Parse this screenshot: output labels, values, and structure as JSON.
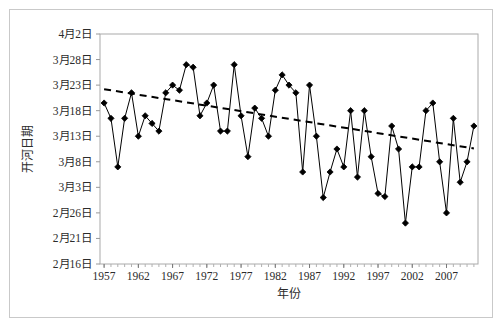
{
  "figure": {
    "background": "#ffffff",
    "border_color": "#c9c9c9"
  },
  "chart_data": {
    "type": "line",
    "title": "",
    "subtitle": "",
    "xlabel": "年份",
    "ylabel": "开河日期",
    "xlim": [
      1956.4,
      2011.6
    ],
    "ylim": [
      0,
      45
    ],
    "grid": false,
    "legend_position": "none",
    "marker": "diamond",
    "marker_color": "#000000",
    "line_color": "#000000",
    "trend_line": {
      "style": "dashed",
      "color": "#000000",
      "start": {
        "x": 1957,
        "y": 34.2
      },
      "end": {
        "x": 2011,
        "y": 22.6
      },
      "description": "下降趋势线"
    },
    "y_ticks": [
      {
        "value": 45,
        "label": "4月2日"
      },
      {
        "value": 40,
        "label": "3月28日"
      },
      {
        "value": 35,
        "label": "3月23日"
      },
      {
        "value": 30,
        "label": "3月18日"
      },
      {
        "value": 25,
        "label": "3月13日"
      },
      {
        "value": 20,
        "label": "3月8日"
      },
      {
        "value": 15,
        "label": "3月3日"
      },
      {
        "value": 10,
        "label": "2月26日"
      },
      {
        "value": 5,
        "label": "2月21日"
      },
      {
        "value": 0,
        "label": "2月16日"
      }
    ],
    "x_ticks": [
      {
        "value": 1957,
        "label": "1957"
      },
      {
        "value": 1962,
        "label": "1962"
      },
      {
        "value": 1967,
        "label": "1967"
      },
      {
        "value": 1972,
        "label": "1972"
      },
      {
        "value": 1977,
        "label": "1977"
      },
      {
        "value": 1982,
        "label": "1982"
      },
      {
        "value": 1987,
        "label": "1987"
      },
      {
        "value": 1992,
        "label": "1992"
      },
      {
        "value": 1997,
        "label": "1997"
      },
      {
        "value": 2002,
        "label": "2002"
      },
      {
        "value": 2007,
        "label": "2007"
      }
    ],
    "x": [
      1957,
      1958,
      1959,
      1960,
      1961,
      1962,
      1963,
      1964,
      1965,
      1966,
      1967,
      1968,
      1969,
      1970,
      1971,
      1972,
      1973,
      1974,
      1975,
      1976,
      1977,
      1978,
      1979,
      1980,
      1981,
      1982,
      1983,
      1984,
      1985,
      1986,
      1987,
      1988,
      1989,
      1990,
      1991,
      1992,
      1993,
      1994,
      1995,
      1996,
      1997,
      1998,
      1999,
      2000,
      2001,
      2002,
      2003,
      2004,
      2005,
      2006,
      2007,
      2008,
      2009,
      2010,
      2011
    ],
    "values": [
      31.5,
      28.5,
      19.0,
      28.5,
      33.5,
      25.0,
      29.0,
      27.5,
      26.0,
      33.5,
      35.0,
      34.0,
      39.0,
      38.5,
      29.0,
      31.5,
      35.0,
      26.0,
      26.0,
      39.0,
      29.0,
      21.0,
      30.5,
      28.5,
      25.0,
      34.0,
      37.0,
      35.0,
      33.5,
      18.0,
      35.0,
      25.0,
      13.0,
      18.0,
      22.5,
      19.0,
      30.0,
      17.0,
      30.0,
      21.0,
      13.8,
      13.2,
      27.0,
      22.5,
      8.0,
      19.0,
      19.0,
      30.0,
      31.5,
      20.0,
      10.0,
      28.5,
      16.0,
      20.0,
      27.0
    ],
    "value_labels": [
      "3月19日",
      "3月16日",
      "3月7日",
      "3月16日",
      "3月21日",
      "3月13日",
      "3月17日",
      "3月15日",
      "3月14日",
      "3月21日",
      "3月23日",
      "3月22日",
      "3月27日",
      "3月26日",
      "3月17日",
      "3月19日",
      "3月23日",
      "3月14日",
      "3月14日",
      "3月27日",
      "3月17日",
      "3月9日",
      "3月18日",
      "3月16日",
      "3月13日",
      "3月22日",
      "3月25日",
      "3月23日",
      "3月21日",
      "3月6日",
      "3月23日",
      "3月13日",
      "3月1日",
      "3月6日",
      "3月10日",
      "3月7日",
      "3月18日",
      "3月5日",
      "3月18日",
      "3月9日",
      "2月29日",
      "2月29日",
      "3月15日",
      "3月10日",
      "2月24日",
      "3月7日",
      "3月7日",
      "3月18日",
      "3月19日",
      "3月8日",
      "2月26日",
      "3月16日",
      "3月4日",
      "3月8日",
      "3月15日"
    ]
  }
}
